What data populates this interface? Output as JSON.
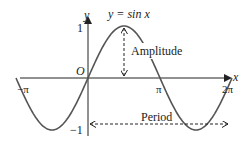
{
  "chart_data": {
    "type": "line",
    "title": "y = sin x",
    "function": "sin",
    "xlabel": "x",
    "ylabel": "y",
    "origin_label": "O",
    "x_ticks": [
      "-π",
      "π",
      "2π"
    ],
    "y_ticks": [
      "1",
      "-1"
    ],
    "x_range": [
      -3.14159,
      6.28318
    ],
    "y_range": [
      -1,
      1
    ],
    "annotations": [
      "Amplitude",
      "Period"
    ],
    "colors": {
      "curve": "#555555",
      "axis": "#222222"
    }
  },
  "labels": {
    "title": "y = sin x",
    "y_axis": "y",
    "x_axis": "x",
    "origin": "O",
    "y_one": "1",
    "y_neg_one": "−1",
    "neg_pi": "−π",
    "pi": "π",
    "two_pi": "2π",
    "amplitude": "Amplitude",
    "period": "Period"
  }
}
